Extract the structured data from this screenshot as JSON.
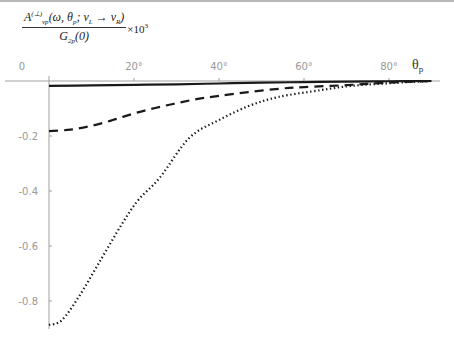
{
  "chart_data": {
    "type": "line",
    "title": "",
    "ylabel": "A_{νp}^{(⊥)}(ω, θ_p; ν_L → ν_R) / G_{2p}(0) × 10^3",
    "ylabel_parts": {
      "numerator": "A",
      "num_sub": "νp",
      "num_sup": "(⊥)",
      "num_args": "(ω, θ",
      "num_args_sub": "p",
      "num_args_rest": "; ν",
      "num_nu1_sub": "L",
      "num_arrow": " → ν",
      "num_nu2_sub": "R",
      "num_close": ")",
      "denominator": "G",
      "den_sub": "2p",
      "den_args": "(0)",
      "multiplier": "×10",
      "multiplier_exp": "3"
    },
    "xlabel": "θ",
    "xlabel_sub": "p",
    "x_ticks": [
      "0",
      "20°",
      "40°",
      "60°",
      "80°"
    ],
    "x_tick_values": [
      0,
      20,
      40,
      60,
      80
    ],
    "y_ticks": [
      "-0.2",
      "-0.4",
      "-0.6",
      "-0.8"
    ],
    "y_tick_values": [
      -0.2,
      -0.4,
      -0.6,
      -0.8
    ],
    "xlim": [
      0,
      92
    ],
    "ylim": [
      -0.9,
      0
    ],
    "grid": false,
    "legend": "none",
    "series": [
      {
        "name": "solid",
        "style": "solid",
        "x": [
          0,
          10,
          20,
          30,
          40,
          50,
          60,
          70,
          80,
          90
        ],
        "values": [
          -0.018,
          -0.016,
          -0.014,
          -0.012,
          -0.009,
          -0.006,
          -0.004,
          -0.002,
          -0.001,
          0.0
        ]
      },
      {
        "name": "dashed",
        "style": "dashed",
        "x": [
          0,
          5,
          10,
          15,
          20,
          25,
          30,
          35,
          40,
          47,
          55,
          60,
          70,
          80,
          90
        ],
        "values": [
          -0.182,
          -0.177,
          -0.163,
          -0.142,
          -0.118,
          -0.098,
          -0.081,
          -0.065,
          -0.054,
          -0.04,
          -0.027,
          -0.022,
          -0.015,
          -0.006,
          0.0
        ]
      },
      {
        "name": "dotted",
        "style": "dotted",
        "x": [
          0,
          3,
          7,
          12,
          17,
          21,
          26,
          33,
          40,
          47,
          54,
          64,
          71,
          80,
          90
        ],
        "values": [
          -0.887,
          -0.87,
          -0.785,
          -0.655,
          -0.524,
          -0.433,
          -0.353,
          -0.207,
          -0.142,
          -0.091,
          -0.058,
          -0.033,
          -0.018,
          -0.008,
          0.0
        ]
      }
    ]
  },
  "plot_px": {
    "x0": 49,
    "x_per_deg": 4.25,
    "y0": 81,
    "y_per_unit": 275
  }
}
